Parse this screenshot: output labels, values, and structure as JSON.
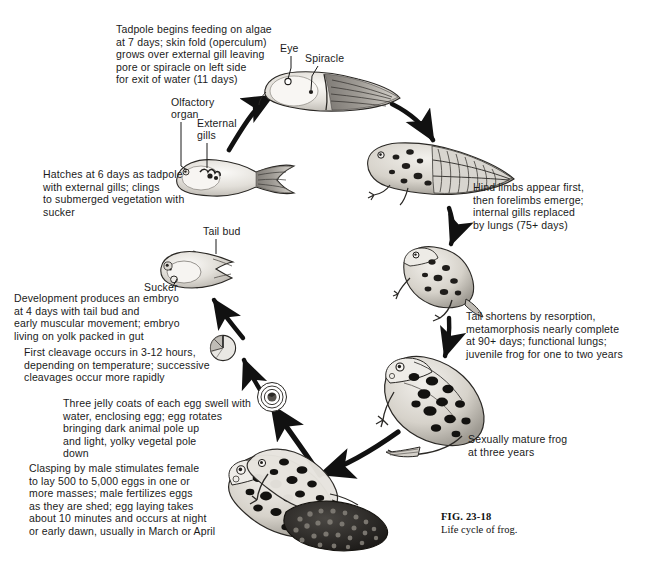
{
  "figure": {
    "number": "FIG. 23-18",
    "caption": "Life cycle of frog.",
    "title": "Life cycle of frog"
  },
  "stages": [
    {
      "id": "feeding-tadpole",
      "text": "Tadpole begins feeding on algae\nat 7 days; skin fold (operculum)\ngrows over external gill leaving\npore or spiracle on left side\nfor exit of water (11 days)"
    },
    {
      "id": "hatchling-tadpole",
      "text": "Hatches at 6 days as tadpole\nwith external gills; clings\nto submerged vegetation with\nsucker"
    },
    {
      "id": "embryo",
      "text": "Development produces an embryo\nat 4 days with tail bud and\nearly muscular movement; embryo\nliving on yolk packed in gut"
    },
    {
      "id": "cleavage",
      "text": "First cleavage occurs in 3-12 hours,\ndepending on temperature; successive\ncleavages occur more rapidly"
    },
    {
      "id": "jelly-coats",
      "text": "Three jelly coats of each egg swell with\nwater, enclosing egg; egg rotates\nbringing dark animal pole up\nand light, yolky vegetal pole\ndown"
    },
    {
      "id": "amplexus",
      "text": "Clasping by male stimulates female\nto lay 500 to 5,000 eggs in one or\nmore masses; male fertilizes eggs\nas they are shed; egg laying takes\nabout 10 minutes and occurs at night\nor early dawn, usually in March or April"
    },
    {
      "id": "hind-limbs",
      "text": "Hind limbs appear first,\nthen forelimbs emerge;\ninternal gills replaced\nby lungs (75+ days)"
    },
    {
      "id": "metamorphosis",
      "text": "Tail shortens by resorption,\nmetamorphosis nearly complete\nat 90+ days; functional lungs;\njuvenile frog for one to two years"
    },
    {
      "id": "mature-frog",
      "text": "Sexually mature frog\nat three years"
    }
  ],
  "anatomy_labels": [
    {
      "id": "eye",
      "text": "Eye"
    },
    {
      "id": "spiracle",
      "text": "Spiracle"
    },
    {
      "id": "olfactory-organ",
      "text": "Olfactory\norgan"
    },
    {
      "id": "external-gills",
      "text": "External\ngills"
    },
    {
      "id": "tail-bud",
      "text": "Tail bud"
    },
    {
      "id": "sucker",
      "text": "Sucker"
    }
  ],
  "colors": {
    "ink": "#1a1a1a",
    "background": "#ffffff",
    "illustration_light": "#e8e6e2",
    "illustration_mid": "#8d8a86",
    "illustration_dark": "#2a2825"
  }
}
